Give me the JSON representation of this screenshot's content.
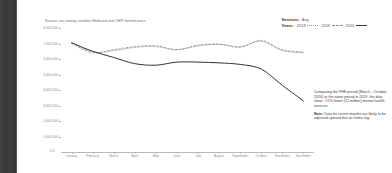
{
  "chart_title": "Service use among enrollee Medicaid and CHIP beneficiaries",
  "legend": {
    "services_key": "Services:",
    "services_value": "Any",
    "years_key": "Years:",
    "years": [
      {
        "label": "2018",
        "style": "dotted",
        "color": "#9a9a9a"
      },
      {
        "label": "2019",
        "style": "dashed",
        "color": "#8d8d8d"
      },
      {
        "label": "2020",
        "style": "solid",
        "color": "#333333"
      }
    ]
  },
  "x_origin_label": "0.0",
  "annotation": {
    "paragraph": "Comparing the PHE period (March – October 2020) to the same period in 2019, the data show ~22% fewer (12 million) mental health services.",
    "note_prefix": "Note:",
    "note": " Data for recent months are likely to be adjusted upward due to claims lag."
  },
  "chart_data": {
    "type": "line",
    "title": "Service use among enrollee Medicaid and CHIP beneficiaries",
    "xlabel": "",
    "ylabel": "",
    "grid": false,
    "legend_position": "top-right",
    "ylim": [
      0,
      8000000
    ],
    "ytick_labels": [
      "8,000,000",
      "7,000,000",
      "6,000,000",
      "5,000,000",
      "4,000,000",
      "3,000,000",
      "2,000,000",
      "1,000,000"
    ],
    "ytick_values": [
      8000000,
      7000000,
      6000000,
      5000000,
      4000000,
      3000000,
      2000000,
      1000000
    ],
    "categories": [
      "January",
      "February",
      "March",
      "April",
      "May",
      "June",
      "July",
      "August",
      "September",
      "October",
      "November",
      "December"
    ],
    "series": [
      {
        "name": "2018",
        "style": "dotted",
        "color": "#9a9a9a",
        "values": [
          7050000,
          6450000,
          6550000,
          6750000,
          6800000,
          6600000,
          6850000,
          6950000,
          6800000,
          7150000,
          6550000,
          6400000
        ]
      },
      {
        "name": "2019",
        "style": "dashed",
        "color": "#8d8d8d",
        "values": [
          7000000,
          6400000,
          6600000,
          6800000,
          6850000,
          6600000,
          6900000,
          6950000,
          6750000,
          7200000,
          6600000,
          6450000
        ]
      },
      {
        "name": "2020",
        "style": "solid",
        "color": "#333333",
        "values": [
          7050000,
          6500000,
          6100000,
          5700000,
          5600000,
          5800000,
          5800000,
          5750000,
          5650000,
          5350000,
          4300000,
          3300000
        ]
      }
    ]
  }
}
